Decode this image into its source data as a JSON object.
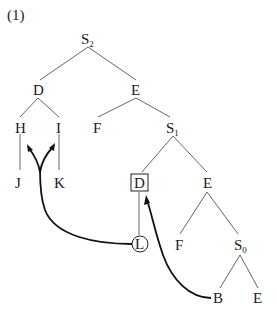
{
  "example_number": "(1)",
  "nodes": {
    "s2": {
      "label": "S",
      "sub": "2"
    },
    "d_top": {
      "label": "D"
    },
    "e_top": {
      "label": "E"
    },
    "h": {
      "label": "H"
    },
    "i": {
      "label": "I"
    },
    "f_mid": {
      "label": "F"
    },
    "s1": {
      "label": "S",
      "sub": "1"
    },
    "j": {
      "label": "J"
    },
    "k": {
      "label": "K"
    },
    "d_boxed": {
      "label": "D"
    },
    "e_mid": {
      "label": "E"
    },
    "l_circled": {
      "label": "L"
    },
    "f_low": {
      "label": "F"
    },
    "s0": {
      "label": "S",
      "sub": "0"
    },
    "b": {
      "label": "B"
    },
    "e_low": {
      "label": "E"
    }
  },
  "edges": [
    [
      "S2",
      "D"
    ],
    [
      "S2",
      "E"
    ],
    [
      "D",
      "H"
    ],
    [
      "D",
      "I"
    ],
    [
      "H",
      "J"
    ],
    [
      "I",
      "K"
    ],
    [
      "E",
      "F"
    ],
    [
      "E",
      "S1"
    ],
    [
      "S1",
      "D(boxed)"
    ],
    [
      "S1",
      "E"
    ],
    [
      "D(boxed)",
      "L"
    ],
    [
      "E",
      "F"
    ],
    [
      "E",
      "S0"
    ],
    [
      "S0",
      "B"
    ],
    [
      "S0",
      "E"
    ]
  ],
  "movement_arrows": [
    {
      "from": "L",
      "to": [
        "H",
        "I"
      ],
      "description": "branching arrow from circled L up to H and I"
    },
    {
      "from": "B",
      "to": "D(boxed)",
      "description": "arrow from B up to boxed D"
    }
  ],
  "colors": {
    "ink": "#1a1a1a",
    "edge": "#555555",
    "background": "#ffffff"
  }
}
